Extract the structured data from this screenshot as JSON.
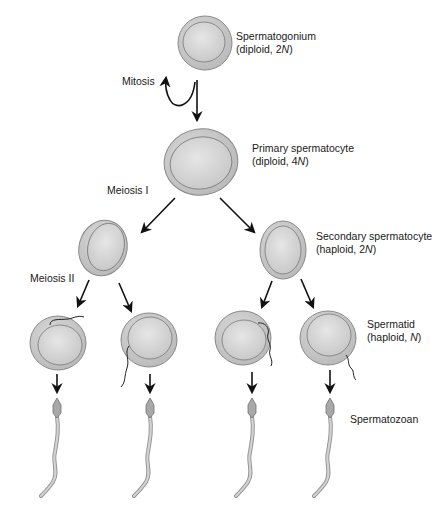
{
  "stages": [
    {
      "id": "spermatogonium",
      "name": "Spermatogonium",
      "ploidy": "diploid",
      "n": "2",
      "n_symbol": "N"
    },
    {
      "id": "primary-spermatocyte",
      "name": "Primary spermatocyte",
      "ploidy": "diploid",
      "n": "4",
      "n_symbol": "N"
    },
    {
      "id": "secondary-spermatocyte",
      "name": "Secondary spermatocyte",
      "ploidy": "haploid",
      "n": "2",
      "n_symbol": "N"
    },
    {
      "id": "spermatid",
      "name": "Spermatid",
      "ploidy": "haploid",
      "n": "",
      "n_symbol": "N"
    },
    {
      "id": "spermatozoan",
      "name": "Spermatozoan"
    }
  ],
  "processes": {
    "mitosis": "Mitosis",
    "meiosis1": "Meiosis I",
    "meiosis2": "Meiosis II"
  },
  "labels": {
    "spermatogonium_l1": "Spermatogonium",
    "spermatogonium_l2a": "(diploid, 2",
    "primary_l1": "Primary spermatocyte",
    "primary_l2a": "(diploid, 4",
    "secondary_l1": "Secondary spermatocyte",
    "secondary_l2a": "(haploid, 2",
    "spermatid_l1": "Spermatid",
    "spermatid_l2a": "(haploid, ",
    "n_symbol": "N",
    "close_paren": ")",
    "spermatozoan": "Spermatozoan"
  },
  "colors": {
    "cell_outer": "#c9c9c9",
    "cell_inner": "#d8d8d8",
    "cell_stroke": "#7a7a7a",
    "arrow": "#111111",
    "sperm": "#b5b5b5"
  }
}
